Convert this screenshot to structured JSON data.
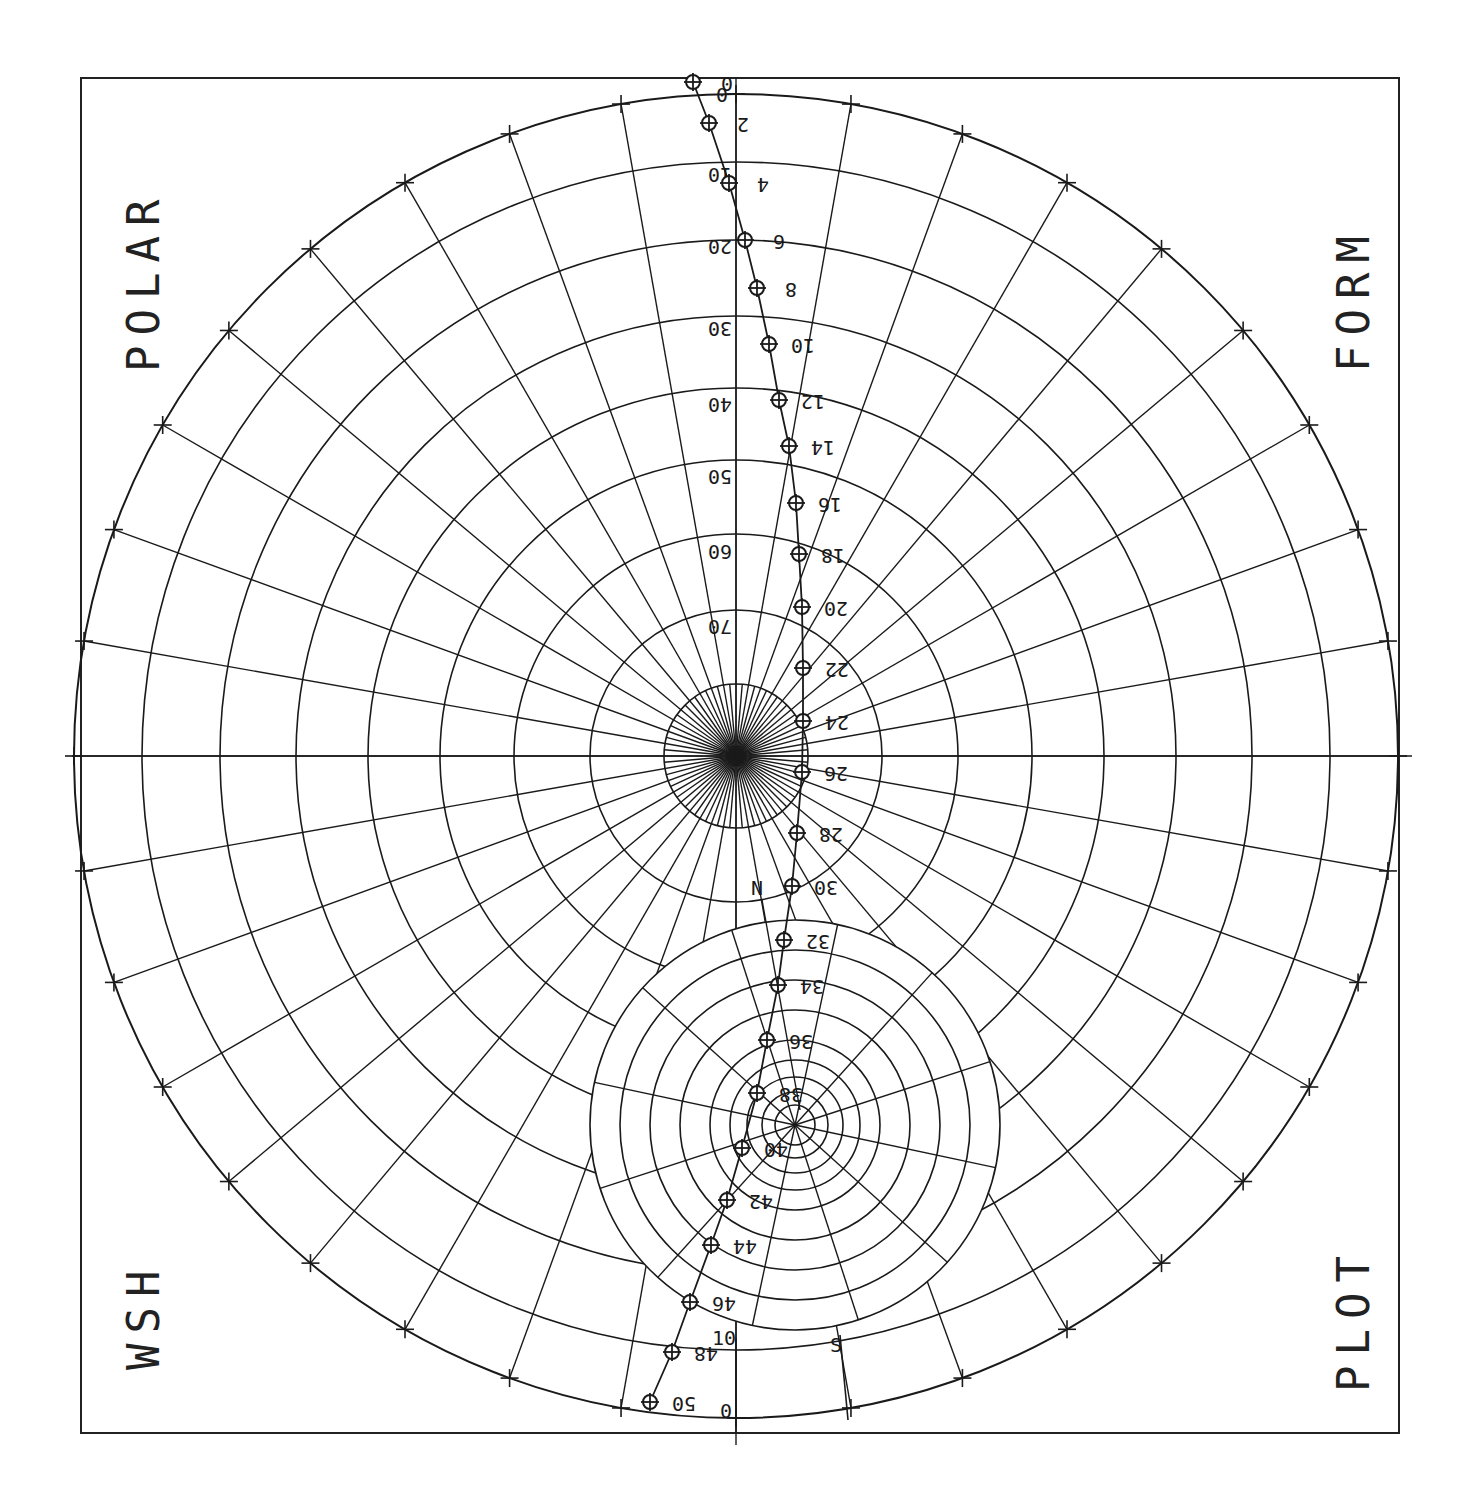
{
  "chart_data": {
    "type": "scatter",
    "corner_labels": {
      "top_left": "POLAR",
      "top_right": "FORM",
      "bottom_left": "WSH",
      "bottom_right": "PLOT"
    },
    "polar_grid": {
      "center": [
        736,
        756
      ],
      "ring_labels": [
        "0",
        "10",
        "20",
        "30",
        "40",
        "50",
        "60",
        "70"
      ],
      "ring_radii": [
        662,
        594,
        516,
        440,
        368,
        296,
        222,
        146,
        72
      ],
      "spoke_step_deg": 10,
      "outer_ticks_step_deg": 10
    },
    "secondary_grid": {
      "center": [
        795,
        1125
      ],
      "ring_radii": [
        205,
        175,
        145,
        115,
        85,
        65,
        48,
        33,
        20
      ],
      "scale_labels": [
        "0",
        "10",
        "S",
        "N"
      ]
    },
    "series": [
      {
        "name": "profile points",
        "labels": [
          "0",
          "2",
          "4",
          "6",
          "8",
          "10",
          "12",
          "14",
          "16",
          "18",
          "20",
          "22",
          "24",
          "26",
          "28",
          "30",
          "32",
          "34",
          "36",
          "38",
          "40",
          "42",
          "44",
          "46",
          "48",
          "50"
        ],
        "x": [
          693,
          709,
          729,
          745,
          757,
          769,
          779,
          789,
          796,
          799,
          802,
          803,
          803,
          802,
          797,
          792,
          784,
          778,
          767,
          757,
          742,
          727,
          711,
          690,
          672,
          650
        ],
        "y": [
          82,
          123,
          183,
          240,
          288,
          344,
          400,
          446,
          503,
          554,
          607,
          668,
          721,
          772,
          833,
          886,
          940,
          985,
          1040,
          1093,
          1148,
          1200,
          1245,
          1302,
          1352,
          1402
        ]
      }
    ],
    "xlabel": "",
    "ylabel": "",
    "grid": true,
    "legend": null
  },
  "labels": {
    "top_left": "POLAR",
    "top_right": "FORM",
    "bottom_left": "WSH",
    "bottom_right": "PLOT"
  }
}
